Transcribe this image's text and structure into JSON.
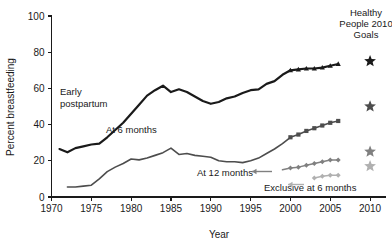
{
  "chart_data": {
    "type": "line",
    "title": "",
    "xlabel": "Year",
    "ylabel": "Percent breastfeeding",
    "xlim": [
      1970,
      2012
    ],
    "ylim": [
      0,
      100
    ],
    "xticks": [
      1970,
      1975,
      1980,
      1985,
      1990,
      1995,
      2000,
      2005,
      2010
    ],
    "yticks": [
      0,
      20,
      40,
      60,
      80,
      100
    ],
    "grid": false,
    "legend_position": "inline-annotations",
    "legend_title": "Healthy People 2010 Goals",
    "legend_title_lines": [
      "Healthy",
      "People 2010",
      "Goals"
    ],
    "colors": {
      "early_postpartum": "#1a1a1a",
      "at_6_months": "#4d4d4d",
      "at_12_months": "#808080",
      "exclusive_at_6_months": "#b0b0b0",
      "axis": "#1a1a1a",
      "background": "#ffffff"
    },
    "series": [
      {
        "name": "Early postpartum",
        "label": "Early postpartum",
        "label_lines": [
          "Early",
          "postpartum"
        ],
        "color": "#1a1a1a",
        "marker": "triangle",
        "marker_from_year": 2000,
        "x": [
          1971,
          1972,
          1973,
          1974,
          1975,
          1976,
          1977,
          1978,
          1979,
          1980,
          1981,
          1982,
          1983,
          1984,
          1985,
          1986,
          1987,
          1988,
          1989,
          1990,
          1991,
          1992,
          1993,
          1994,
          1995,
          1996,
          1997,
          1998,
          1999,
          2000,
          2001,
          2002,
          2003,
          2004,
          2005,
          2006
        ],
        "y": [
          26.5,
          24.7,
          27.0,
          28.0,
          29.0,
          29.5,
          33.0,
          37.0,
          41.0,
          46.0,
          51.0,
          56.0,
          59.0,
          61.5,
          58.0,
          59.5,
          58.0,
          55.5,
          53.0,
          51.5,
          52.5,
          54.5,
          55.5,
          57.5,
          59.0,
          59.5,
          62.5,
          64.0,
          67.5,
          70.0,
          70.5,
          71.0,
          71.0,
          71.5,
          72.5,
          73.5
        ]
      },
      {
        "name": "At 6 months",
        "label": "At 6 months",
        "color": "#4d4d4d",
        "marker": "square",
        "marker_from_year": 2000,
        "x": [
          1972,
          1973,
          1974,
          1975,
          1976,
          1977,
          1978,
          1979,
          1980,
          1981,
          1982,
          1983,
          1984,
          1985,
          1986,
          1987,
          1988,
          1989,
          1990,
          1991,
          1992,
          1993,
          1994,
          1995,
          1996,
          1997,
          1998,
          1999,
          2000,
          2001,
          2002,
          2003,
          2004,
          2005,
          2006
        ],
        "y": [
          5.5,
          5.5,
          6.0,
          6.5,
          10.0,
          14.0,
          16.5,
          18.5,
          21.0,
          20.5,
          21.5,
          23.0,
          24.5,
          27.0,
          23.5,
          24.0,
          23.0,
          22.5,
          22.0,
          20.0,
          19.5,
          19.5,
          19.0,
          20.0,
          21.5,
          24.0,
          26.5,
          29.5,
          33.0,
          34.5,
          36.5,
          38.0,
          39.5,
          41.0,
          42.0
        ]
      },
      {
        "name": "At 12 months",
        "label": "At 12 months",
        "color": "#808080",
        "marker": "diamond",
        "marker_from_year": 2000,
        "x": [
          1999,
          2000,
          2001,
          2002,
          2003,
          2004,
          2005,
          2006
        ],
        "y": [
          15.0,
          16.0,
          16.5,
          17.5,
          18.5,
          19.5,
          20.5,
          20.5
        ]
      },
      {
        "name": "Exclusive at 6 months",
        "label": "Exclusive at 6 months",
        "color": "#b0b0b0",
        "marker": "diamond",
        "marker_from_year": 2003,
        "x": [
          2003,
          2004,
          2005,
          2006
        ],
        "y": [
          10.5,
          11.5,
          12.0,
          12.0
        ]
      }
    ],
    "goal_markers": [
      {
        "name": "early-postpartum-goal",
        "series": "Early postpartum",
        "year": 2010,
        "value": 75,
        "color": "#1a1a1a",
        "marker": "star"
      },
      {
        "name": "at-6-months-goal",
        "series": "At 6 months",
        "year": 2010,
        "value": 50,
        "color": "#4d4d4d",
        "marker": "star"
      },
      {
        "name": "at-12-months-goal",
        "series": "At 12 months",
        "year": 2010,
        "value": 25,
        "color": "#808080",
        "marker": "star"
      },
      {
        "name": "exclusive-at-6-months-goal",
        "series": "Exclusive at 6 months",
        "year": 2010,
        "value": 17,
        "color": "#b0b0b0",
        "marker": "star"
      }
    ],
    "annotations": [
      {
        "name": "early-postpartum-annotation",
        "text_lines": [
          "Early",
          "postpartum"
        ],
        "x": 60,
        "y": 92
      },
      {
        "name": "at-6-months-annotation",
        "text_lines": [
          "At 6 months"
        ],
        "x": 106,
        "y": 133
      },
      {
        "name": "at-12-months-annotation",
        "text_lines": [
          "At 12 months"
        ],
        "x": 198,
        "y": 175
      },
      {
        "name": "exclusive-at-6-months-annotation",
        "text_lines": [
          "Exclusive at 6 months"
        ],
        "x": 264,
        "y": 190
      }
    ]
  },
  "axes": {
    "y_title": "Percent breastfeeding",
    "x_title": "Year",
    "y_tick_labels": [
      "100",
      "80",
      "60",
      "40",
      "20",
      "0"
    ],
    "x_tick_labels": [
      "1970",
      "1975",
      "1980",
      "1985",
      "1990",
      "1995",
      "2000",
      "2005",
      "2010"
    ]
  },
  "legend": {
    "line1": "Healthy",
    "line2": "People 2010",
    "line3": "Goals"
  },
  "labels": {
    "early_postpartum_1": "Early",
    "early_postpartum_2": "postpartum",
    "at_6_months": "At 6 months",
    "at_12_months": "At 12 months",
    "exclusive_at_6_months": "Exclusive at 6 months"
  }
}
